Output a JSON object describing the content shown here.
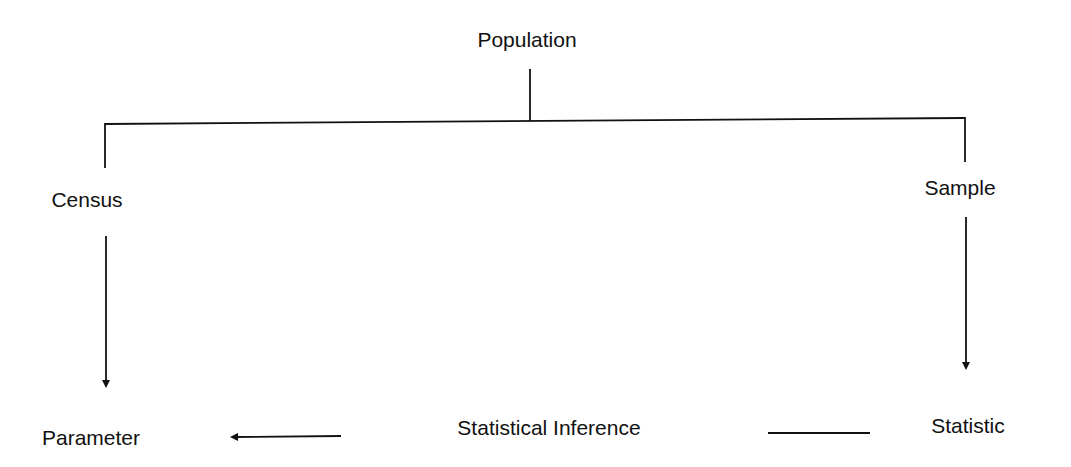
{
  "diagram": {
    "type": "tree-flow",
    "nodes": {
      "population": "Population",
      "census": "Census",
      "sample": "Sample",
      "parameter": "Parameter",
      "inference": "Statistical Inference",
      "statistic": "Statistic"
    },
    "edges": [
      {
        "from": "Population",
        "to": "Census",
        "style": "line"
      },
      {
        "from": "Population",
        "to": "Sample",
        "style": "line"
      },
      {
        "from": "Census",
        "to": "Parameter",
        "style": "arrow"
      },
      {
        "from": "Sample",
        "to": "Statistic",
        "style": "arrow"
      },
      {
        "from": "Statistic",
        "to": "Parameter",
        "via": "Statistical Inference",
        "style": "arrow"
      }
    ],
    "colors": {
      "ink": "#111111",
      "background": "#ffffff"
    }
  }
}
